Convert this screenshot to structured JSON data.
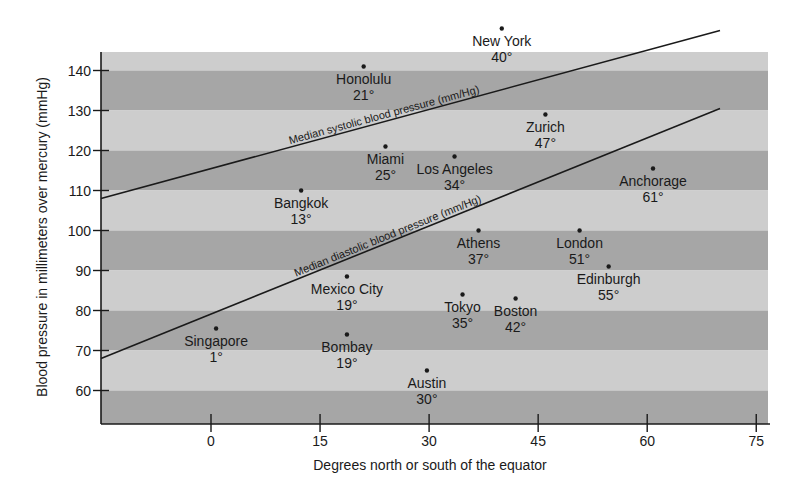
{
  "chart_data": {
    "type": "scatter",
    "title": "",
    "xlabel": "Degrees north or south of the equator",
    "ylabel": "Blood pressure in millimeters over mercury (mmHg)",
    "xlim": [
      -15,
      77
    ],
    "ylim": [
      55,
      145
    ],
    "x_ticks": [
      0,
      15,
      30,
      45,
      60,
      75
    ],
    "y_ticks": [
      60,
      70,
      80,
      90,
      100,
      110,
      120,
      130,
      140
    ],
    "grid": false,
    "background_bands": {
      "dark": "#a6a6a6",
      "light": "#cdcdcd",
      "band_size": 10
    },
    "points": [
      {
        "name": "New York",
        "label": "40°",
        "x": 40,
        "y": 150.5
      },
      {
        "name": "Honolulu",
        "label": "21°",
        "x": 21,
        "y": 141
      },
      {
        "name": "Zurich",
        "label": "47°",
        "x": 46,
        "y": 129
      },
      {
        "name": "Miami",
        "label": "25°",
        "x": 24,
        "y": 121
      },
      {
        "name": "Los Angeles",
        "label": "34°",
        "x": 33.5,
        "y": 118.5
      },
      {
        "name": "Anchorage",
        "label": "61°",
        "x": 60.8,
        "y": 115.5
      },
      {
        "name": "Bangkok",
        "label": "13°",
        "x": 12.4,
        "y": 110
      },
      {
        "name": "Athens",
        "label": "37°",
        "x": 36.8,
        "y": 100
      },
      {
        "name": "London",
        "label": "51°",
        "x": 50.7,
        "y": 100
      },
      {
        "name": "Edinburgh",
        "label": "55°",
        "x": 54.7,
        "y": 91
      },
      {
        "name": "Mexico City",
        "label": "19°",
        "x": 18.7,
        "y": 88.5
      },
      {
        "name": "Tokyo",
        "label": "35°",
        "x": 34.6,
        "y": 84
      },
      {
        "name": "Boston",
        "label": "42°",
        "x": 41.9,
        "y": 83
      },
      {
        "name": "Singapore",
        "label": "1°",
        "x": 0.7,
        "y": 75.5
      },
      {
        "name": "Bombay",
        "label": "19°",
        "x": 18.7,
        "y": 74
      },
      {
        "name": "Austin",
        "label": "30°",
        "x": 29.7,
        "y": 65
      }
    ],
    "series": [
      {
        "name": "Median systolic blood pressure (mm/Hg)",
        "type": "line",
        "x": [
          -15,
          70
        ],
        "y": [
          108,
          150
        ]
      },
      {
        "name": "Median diastolic blood pressure (mm/Hg)",
        "type": "line",
        "x": [
          -15,
          70
        ],
        "y": [
          68,
          130.5
        ]
      }
    ]
  },
  "labels": {
    "systolic_line": "Median systolic blood pressure (mm/Hg)",
    "diastolic_line": "Median diastolic blood pressure (mm/Hg)"
  },
  "colors": {
    "band_dark": "#a6a6a6",
    "band_light": "#cdcdcd",
    "ink": "#1a1a1a"
  }
}
